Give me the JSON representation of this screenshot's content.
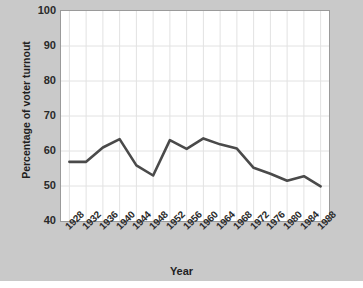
{
  "chart_data": {
    "type": "line",
    "title": "",
    "xlabel": "Year",
    "ylabel": "Percentage of voter turnout",
    "categories": [
      "1928",
      "1932",
      "1936",
      "1940",
      "1944",
      "1948",
      "1952",
      "1956",
      "1960",
      "1964",
      "1968",
      "1972",
      "1976",
      "1980",
      "1984",
      "1988"
    ],
    "values": [
      56.9,
      56.9,
      61.0,
      63.4,
      55.9,
      53.0,
      63.1,
      60.6,
      63.6,
      61.9,
      60.7,
      55.2,
      53.5,
      51.5,
      52.8,
      49.9
    ],
    "series": [
      {
        "name": "Voter turnout",
        "values": [
          56.9,
          56.9,
          61.0,
          63.4,
          55.9,
          53.0,
          63.1,
          60.6,
          63.6,
          61.9,
          60.7,
          55.2,
          53.5,
          51.5,
          52.8,
          49.9
        ]
      }
    ],
    "ylim": [
      40,
      100
    ],
    "yticks": [
      "40",
      "50",
      "60",
      "70",
      "80",
      "90",
      "100"
    ],
    "ytick_values": [
      40,
      50,
      60,
      70,
      80,
      90,
      100
    ],
    "xtick_rotation": -45,
    "grid": true,
    "legend": "none",
    "line_color": "#4a4a4a",
    "plot_background": "#ffffff",
    "figure_background": "#c9c9c9",
    "grid_color": "#e2e2e2",
    "axis_color": "#9a9a9a"
  }
}
